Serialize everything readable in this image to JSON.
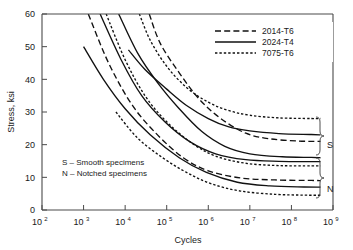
{
  "chart_data": {
    "type": "line",
    "title": "",
    "subtitle": "",
    "xlabel": "Cycles",
    "ylabel": "Stress, ksi",
    "xscale": "log",
    "xlim": [
      100,
      1000000000
    ],
    "ylim": [
      0,
      60
    ],
    "grid": false,
    "legend_position": "top-right",
    "x_ticks": [
      {
        "label": "10",
        "exp": "2",
        "value": 100
      },
      {
        "label": "10",
        "exp": "3",
        "value": 1000
      },
      {
        "label": "10",
        "exp": "4",
        "value": 10000
      },
      {
        "label": "10",
        "exp": "5",
        "value": 100000
      },
      {
        "label": "10",
        "exp": "6",
        "value": 1000000
      },
      {
        "label": "10",
        "exp": "7",
        "value": 10000000
      },
      {
        "label": "10",
        "exp": "8",
        "value": 100000000
      },
      {
        "label": "10",
        "exp": "9",
        "value": 1000000000
      }
    ],
    "y_ticks": [
      0,
      10,
      20,
      30,
      40,
      50,
      60
    ],
    "legend": [
      {
        "name": "2014-T6",
        "style": "dashed"
      },
      {
        "name": "2024-T4",
        "style": "solid"
      },
      {
        "name": "7075-T6",
        "style": "dotted"
      }
    ],
    "annotations": [
      {
        "name": "smooth-note",
        "text": "S – Smooth specimens"
      },
      {
        "name": "notched-note",
        "text": "N – Notched specimens"
      },
      {
        "name": "group-smooth",
        "text": "S"
      },
      {
        "name": "group-notched",
        "text": "N"
      }
    ],
    "series": [
      {
        "name": "7075-T6 smooth",
        "alloy": "7075-T6",
        "specimen": "S",
        "style": "dotted",
        "points": [
          [
            22000,
            60
          ],
          [
            40000,
            52
          ],
          [
            100000,
            44
          ],
          [
            300000,
            37.5
          ],
          [
            1000000,
            33
          ],
          [
            3000000,
            30.5
          ],
          [
            10000000,
            29
          ],
          [
            50000000,
            28.2
          ],
          [
            300000000,
            28
          ],
          [
            500000000,
            28
          ]
        ]
      },
      {
        "name": "2024-T4 smooth",
        "alloy": "2024-T4",
        "specimen": "S",
        "style": "solid",
        "points": [
          [
            12000,
            49
          ],
          [
            30000,
            43
          ],
          [
            100000,
            37
          ],
          [
            300000,
            32
          ],
          [
            1000000,
            28
          ],
          [
            3000000,
            25.5
          ],
          [
            10000000,
            24.2
          ],
          [
            50000000,
            23.4
          ],
          [
            300000000,
            23.1
          ],
          [
            500000000,
            23
          ]
        ]
      },
      {
        "name": "2014-T6 smooth",
        "alloy": "2014-T6",
        "specimen": "S",
        "style": "dashed",
        "points": [
          [
            38000,
            60
          ],
          [
            70000,
            51
          ],
          [
            200000,
            42
          ],
          [
            600000,
            34
          ],
          [
            2000000,
            28
          ],
          [
            8000000,
            23.5
          ],
          [
            30000000,
            21.8
          ],
          [
            150000000,
            21.1
          ],
          [
            500000000,
            21
          ]
        ]
      },
      {
        "name": "2024-T4 smooth lower",
        "alloy": "2024-T4",
        "specimen": "S",
        "style": "solid",
        "points": [
          [
            7000,
            60
          ],
          [
            20000,
            48
          ],
          [
            60000,
            39
          ],
          [
            200000,
            31
          ],
          [
            700000,
            24
          ],
          [
            2500000,
            19.5
          ],
          [
            10000000,
            17.2
          ],
          [
            60000000,
            16.3
          ],
          [
            300000000,
            16.1
          ],
          [
            500000000,
            16
          ]
        ]
      },
      {
        "name": "7075-T6 notched",
        "alloy": "7075-T6",
        "specimen": "N",
        "style": "dotted",
        "points": [
          [
            3500,
            60
          ],
          [
            10000,
            46
          ],
          [
            30000,
            35
          ],
          [
            100000,
            27
          ],
          [
            400000,
            20.5
          ],
          [
            1500000,
            16.5
          ],
          [
            8000000,
            14.3
          ],
          [
            50000000,
            13.6
          ],
          [
            300000000,
            13.5
          ],
          [
            500000000,
            13.5
          ]
        ]
      },
      {
        "name": "2024-T4 notched",
        "alloy": "2024-T4",
        "specimen": "N",
        "style": "solid",
        "points": [
          [
            2500,
            60
          ],
          [
            8000,
            46
          ],
          [
            25000,
            35
          ],
          [
            90000,
            27
          ],
          [
            350000,
            21
          ],
          [
            1500000,
            17.2
          ],
          [
            8000000,
            15.4
          ],
          [
            50000000,
            14.9
          ],
          [
            300000000,
            14.8
          ],
          [
            500000000,
            14.8
          ]
        ]
      },
      {
        "name": "2014-T6 notched",
        "alloy": "2014-T6",
        "specimen": "N",
        "style": "dashed",
        "points": [
          [
            1300,
            60
          ],
          [
            4000,
            45
          ],
          [
            15000,
            32
          ],
          [
            60000,
            23
          ],
          [
            250000,
            16
          ],
          [
            1000000,
            12
          ],
          [
            6000000,
            9.8
          ],
          [
            40000000,
            9.2
          ],
          [
            300000000,
            9.05
          ],
          [
            500000000,
            9
          ]
        ]
      },
      {
        "name": "2024-T4 notched lower",
        "alloy": "2024-T4",
        "specimen": "N",
        "style": "solid",
        "points": [
          [
            1000,
            50
          ],
          [
            3000,
            40
          ],
          [
            10000,
            31
          ],
          [
            40000,
            23
          ],
          [
            200000,
            16
          ],
          [
            900000,
            11.5
          ],
          [
            5000000,
            8.5
          ],
          [
            30000000,
            7.4
          ],
          [
            200000000,
            7.05
          ],
          [
            500000000,
            7
          ]
        ]
      },
      {
        "name": "7075-T6 notched lower",
        "alloy": "7075-T6",
        "specimen": "N",
        "style": "dotted",
        "points": [
          [
            6000,
            30
          ],
          [
            20000,
            22
          ],
          [
            80000,
            16
          ],
          [
            300000,
            11.5
          ],
          [
            1200000,
            8
          ],
          [
            6000000,
            5.8
          ],
          [
            40000000,
            4.8
          ],
          [
            200000000,
            4.55
          ],
          [
            500000000,
            4.5
          ]
        ]
      }
    ]
  }
}
